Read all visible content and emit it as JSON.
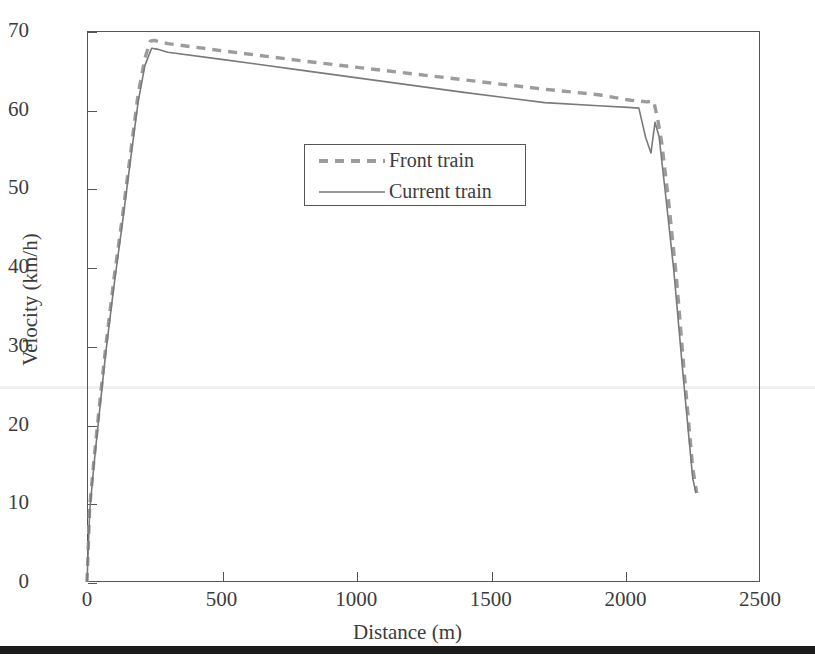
{
  "chart_data": {
    "type": "line",
    "title": "",
    "xlabel": "Distance (m)",
    "ylabel": "Velocity (km/h)",
    "xlim": [
      0,
      2500
    ],
    "ylim": [
      0,
      70
    ],
    "xticks": [
      0,
      500,
      1000,
      1500,
      2000,
      2500
    ],
    "yticks": [
      0,
      10,
      20,
      30,
      40,
      50,
      60,
      70
    ],
    "xtick_labels": [
      "0",
      "500",
      "1000",
      "1500",
      "2000",
      "2500"
    ],
    "ytick_labels": [
      "0",
      "10",
      "20",
      "30",
      "40",
      "50",
      "60",
      "70"
    ],
    "grid": false,
    "legend_position": "upper center",
    "series": [
      {
        "name": "Front train",
        "style": "dashed",
        "color": "#9c9c9c",
        "linewidth": 3.4,
        "x": [
          0,
          10,
          25,
          45,
          70,
          100,
          130,
          160,
          190,
          215,
          235,
          250,
          300,
          500,
          800,
          1100,
          1400,
          1700,
          1900,
          2020,
          2080,
          2105,
          2120,
          2135,
          2160,
          2190,
          2220,
          2250,
          2265
        ],
        "y": [
          0,
          9.5,
          15.2,
          22.0,
          30.0,
          38.5,
          46.0,
          54.0,
          62.0,
          66.5,
          68.7,
          68.8,
          68.4,
          67.5,
          66.2,
          65.0,
          63.8,
          62.6,
          61.9,
          61.2,
          61.0,
          61.1,
          58.8,
          55.8,
          48.5,
          38.5,
          26.0,
          14.5,
          11.3
        ]
      },
      {
        "name": "Current train",
        "style": "solid",
        "color": "#7a7a7a",
        "linewidth": 1.6,
        "x": [
          0,
          10,
          25,
          45,
          70,
          100,
          130,
          160,
          190,
          215,
          240,
          260,
          300,
          500,
          800,
          1100,
          1400,
          1700,
          1900,
          2010,
          2050,
          2075,
          2095,
          2110,
          2125,
          2150,
          2180,
          2215,
          2250,
          2262
        ],
        "y": [
          0,
          9.0,
          14.6,
          21.2,
          29.2,
          37.6,
          45.2,
          53.2,
          61.0,
          65.6,
          67.8,
          67.7,
          67.3,
          66.4,
          65.0,
          63.6,
          62.2,
          60.9,
          60.5,
          60.3,
          60.2,
          56.5,
          54.5,
          58.4,
          56.6,
          49.0,
          39.5,
          26.0,
          13.2,
          11.3
        ]
      }
    ]
  },
  "legend": {
    "entries": [
      {
        "label": "Front train",
        "icon": "dashed-line-swatch"
      },
      {
        "label": "Current train",
        "icon": "solid-line-swatch"
      }
    ]
  },
  "colors": {
    "front_train": "#9c9c9c",
    "current_train": "#7a7a7a",
    "axis": "#555555",
    "text": "#3c3c3c",
    "background": "#ffffff",
    "bottom_rule": "#1b1b1b"
  }
}
